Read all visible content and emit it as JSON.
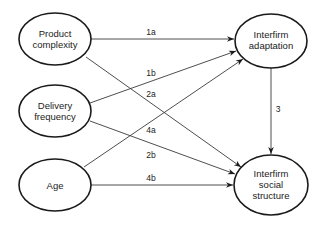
{
  "diagram": {
    "nodes": [
      {
        "id": "product_complexity",
        "lines": [
          "Product",
          "complexity"
        ]
      },
      {
        "id": "delivery_frequency",
        "lines": [
          "Delivery",
          "frequency"
        ]
      },
      {
        "id": "age",
        "lines": [
          "Age"
        ]
      },
      {
        "id": "interfirm_adaptation",
        "lines": [
          "Interfirm",
          "adaptation"
        ]
      },
      {
        "id": "interfirm_social_structure",
        "lines": [
          "Interfirm",
          "social",
          "structure"
        ]
      }
    ],
    "edges": [
      {
        "from": "product_complexity",
        "to": "interfirm_adaptation",
        "label": "1a"
      },
      {
        "from": "delivery_frequency",
        "to": "interfirm_adaptation",
        "label": "1b"
      },
      {
        "from": "product_complexity",
        "to": "interfirm_social_structure",
        "label": "2a"
      },
      {
        "from": "delivery_frequency",
        "to": "interfirm_social_structure",
        "label": "2b"
      },
      {
        "from": "interfirm_adaptation",
        "to": "interfirm_social_structure",
        "label": "3"
      },
      {
        "from": "age",
        "to": "interfirm_adaptation",
        "label": "4a"
      },
      {
        "from": "age",
        "to": "interfirm_social_structure",
        "label": "4b"
      }
    ]
  }
}
